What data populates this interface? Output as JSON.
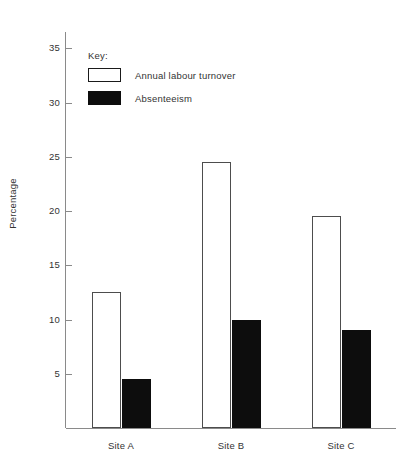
{
  "chart_data": {
    "type": "bar",
    "title": "",
    "subtitle": "",
    "xlabel": "",
    "ylabel": "Percentage",
    "categories": [
      "Site A",
      "Site B",
      "Site C"
    ],
    "series": [
      {
        "name": "Annual labour turnover",
        "values": [
          12.5,
          24.5,
          19.5
        ],
        "color": "#ffffff",
        "edge_color": "#4d4d4d",
        "style": "open"
      },
      {
        "name": "Absenteeism",
        "values": [
          4.5,
          10.0,
          9.0
        ],
        "color": "#0d0d0d",
        "edge_color": "#0d0d0d",
        "style": "filled"
      }
    ],
    "ylim": [
      0,
      36.5
    ],
    "yticks": [
      5,
      10,
      15,
      20,
      25,
      30,
      35
    ],
    "ytick_labels": [
      "5",
      "10",
      "15",
      "20",
      "25",
      "30",
      "35"
    ],
    "grid": false,
    "legend_position": "upper-left-inside",
    "legend_title": "Key:",
    "axis_color": "#8a8a8a",
    "text_color": "#333333"
  },
  "legend": {
    "title": "Key:",
    "entries": [
      {
        "label": "Annual labour turnover",
        "swatch": "open-rectangle-swatch"
      },
      {
        "label": "Absenteeism",
        "swatch": "filled-rectangle-swatch"
      }
    ]
  },
  "axes": {
    "y_title": "Percentage",
    "y_tick_labels": [
      "35",
      "30",
      "25",
      "20",
      "15",
      "10",
      "5"
    ],
    "x_tick_labels": [
      "Site A",
      "Site B",
      "Site C"
    ]
  }
}
